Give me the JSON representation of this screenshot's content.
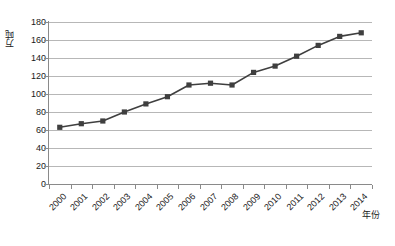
{
  "chart_data": {
    "type": "line",
    "title": "",
    "xlabel": "年份",
    "ylabel": "万吨",
    "categories": [
      "2000",
      "2001",
      "2002",
      "2003",
      "2004",
      "2005",
      "2006",
      "2007",
      "2008",
      "2009",
      "2010",
      "2011",
      "2012",
      "2013",
      "2014"
    ],
    "values": [
      63,
      67,
      70,
      80,
      89,
      97,
      110,
      112,
      110,
      124,
      131,
      142,
      154,
      164,
      168
    ],
    "series": [
      {
        "name": "万吨",
        "values": [
          63,
          67,
          70,
          80,
          89,
          97,
          110,
          112,
          110,
          124,
          131,
          142,
          154,
          164,
          168
        ]
      }
    ],
    "ylim": [
      0,
      180
    ],
    "y_ticks": [
      0,
      20,
      40,
      60,
      80,
      100,
      120,
      140,
      160,
      180
    ],
    "y_tick_labels": [
      "0",
      "20",
      "40",
      "60",
      "80",
      "100",
      "120",
      "140",
      "160",
      "180"
    ],
    "x_tick_labels": [
      "2000",
      "2001",
      "2002",
      "2003",
      "2004",
      "2005",
      "2006",
      "2007",
      "2008",
      "2009",
      "2010",
      "2011",
      "2012",
      "2013",
      "2014"
    ],
    "grid": true,
    "grid_axis": "y",
    "legend": false,
    "legend_position": "none",
    "marker": "square",
    "line_color": "#3f3f3f",
    "marker_color": "#3f3f3f",
    "grid_color": "#b7b7b7",
    "axis_color": "#8a8a8a",
    "text_color": "#1a1a1a",
    "background_color": "#ffffff"
  }
}
